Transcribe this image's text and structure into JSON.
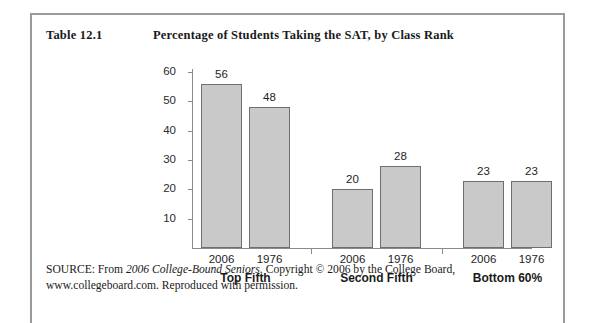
{
  "caption": {
    "label": "Table 12.1",
    "title": "Percentage of Students Taking the SAT, by Class Rank"
  },
  "source": {
    "prefix": "SOURCE: From ",
    "italic_title": "2006 College-Bound Seniors",
    "suffix": ". Copyright © 2006 by the College Board, www.collegeboard.com. Reproduced with permission."
  },
  "chart_data": {
    "type": "bar",
    "title": "Percentage of Students Taking the SAT, by Class Rank",
    "xlabel": "",
    "ylabel": "",
    "ylim": [
      0,
      60
    ],
    "yticks": [
      10,
      20,
      30,
      40,
      50,
      60
    ],
    "grid": false,
    "legend": "none",
    "categories": [
      "Top Fifth",
      "Second Fifth",
      "Bottom 60%"
    ],
    "subcategories": [
      "2006",
      "1976"
    ],
    "series": [
      {
        "name": "2006",
        "values": [
          56,
          20,
          23
        ]
      },
      {
        "name": "1976",
        "values": [
          48,
          28,
          23
        ]
      }
    ],
    "bars": [
      {
        "group": "Top Fifth",
        "year": "2006",
        "value": 56
      },
      {
        "group": "Top Fifth",
        "year": "1976",
        "value": 48
      },
      {
        "group": "Second Fifth",
        "year": "2006",
        "value": 20
      },
      {
        "group": "Second Fifth",
        "year": "1976",
        "value": 28
      },
      {
        "group": "Bottom 60%",
        "year": "2006",
        "value": 23
      },
      {
        "group": "Bottom 60%",
        "year": "1976",
        "value": 23
      }
    ],
    "colors": {
      "bar_fill": "#c9c9c9",
      "bar_border": "#6f6f6f",
      "axis": "#8a8a8a"
    }
  }
}
